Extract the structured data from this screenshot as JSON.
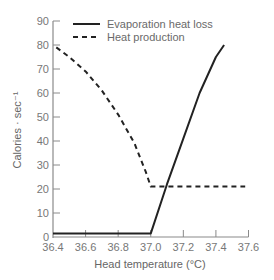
{
  "chart_data": {
    "type": "line",
    "title": "",
    "xlabel": "Head temperature (°C)",
    "ylabel": "Calories · sec⁻¹",
    "xlim": [
      36.4,
      37.6
    ],
    "ylim": [
      0,
      90
    ],
    "xticks": [
      36.4,
      36.6,
      36.8,
      37.0,
      37.2,
      37.4,
      37.6
    ],
    "xtick_labels": [
      "36.4",
      "36.6",
      "36.8",
      "37.0",
      "37.2",
      "37.4",
      "37.6"
    ],
    "yticks": [
      0,
      10,
      20,
      30,
      40,
      50,
      60,
      70,
      80,
      90
    ],
    "ytick_labels": [
      "0",
      "10",
      "20",
      "30",
      "40",
      "50",
      "60",
      "70",
      "80",
      "90"
    ],
    "grid": false,
    "legend_position": "upper left (inside)",
    "series": [
      {
        "name": "Evaporation heat loss",
        "style": "solid",
        "color": "#222222",
        "points": [
          [
            36.4,
            1.5
          ],
          [
            37.0,
            1.5
          ],
          [
            37.1,
            22
          ],
          [
            37.2,
            41
          ],
          [
            37.3,
            60
          ],
          [
            37.4,
            75
          ],
          [
            37.45,
            80
          ]
        ]
      },
      {
        "name": "Heat production",
        "style": "dashed",
        "color": "#222222",
        "points": [
          [
            36.42,
            79
          ],
          [
            36.5,
            75
          ],
          [
            36.6,
            69
          ],
          [
            36.7,
            61
          ],
          [
            36.8,
            51
          ],
          [
            36.9,
            39
          ],
          [
            36.97,
            27
          ],
          [
            37.0,
            21
          ],
          [
            37.1,
            21
          ],
          [
            37.3,
            21
          ],
          [
            37.58,
            21
          ]
        ]
      }
    ]
  },
  "legend": {
    "items": [
      {
        "label": "Evaporation heat loss",
        "style": "solid"
      },
      {
        "label": "Heat production",
        "style": "dashed"
      }
    ]
  },
  "axes": {
    "x_label": "Head temperature (°C)",
    "y_label": "Calories · sec⁻¹"
  }
}
